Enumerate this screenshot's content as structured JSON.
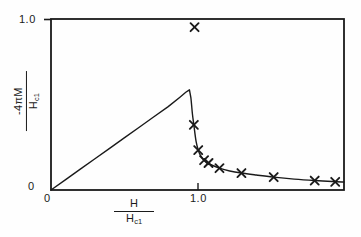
{
  "figure": {
    "background_color": "#fefefe",
    "ink_color": "#1a1a1a"
  },
  "axes": {
    "x_title": {
      "numerator": "H",
      "denominator": "H",
      "denominator_sub": "c1"
    },
    "y_title": {
      "numerator": "-4πM",
      "denominator": "H",
      "denominator_sub": "c1"
    },
    "y_tick_top": "1.0",
    "y_tick_bottom": "0",
    "x_tick_origin": "0",
    "x_tick_one": "1.0"
  },
  "chart_data": {
    "type": "line",
    "title": "",
    "xlabel": "H / H_c1",
    "ylabel": "-4πM / H_c1",
    "xlim": [
      0,
      2.0
    ],
    "ylim": [
      0,
      1.05
    ],
    "grid": false,
    "legend": false,
    "xticks": [
      0,
      1.0
    ],
    "xticklabels": [
      "0",
      "1.0"
    ],
    "yticks": [
      0,
      1.0
    ],
    "yticklabels": [
      "0",
      "1.0"
    ],
    "series": [
      {
        "name": "theoretical curve",
        "style": "solid-line",
        "x": [
          0.0,
          0.1,
          0.2,
          0.3,
          0.4,
          0.5,
          0.6,
          0.7,
          0.8,
          0.88,
          0.92,
          0.945,
          0.955,
          0.965,
          0.975,
          0.99,
          1.005,
          1.02,
          1.045,
          1.07,
          1.1,
          1.15,
          1.22,
          1.3,
          1.4,
          1.52,
          1.66,
          1.8,
          1.92,
          2.0
        ],
        "y": [
          0.0,
          0.064,
          0.128,
          0.192,
          0.256,
          0.32,
          0.384,
          0.448,
          0.512,
          0.57,
          0.6,
          0.615,
          0.565,
          0.47,
          0.4,
          0.3,
          0.245,
          0.212,
          0.183,
          0.166,
          0.152,
          0.134,
          0.117,
          0.104,
          0.092,
          0.079,
          0.067,
          0.058,
          0.052,
          0.049
        ]
      },
      {
        "name": "measured data points",
        "style": "x-markers",
        "x": [
          0.98,
          0.975,
          1.005,
          1.045,
          1.075,
          1.15,
          1.3,
          1.52,
          1.8,
          1.94
        ],
        "y": [
          1.0,
          0.4,
          0.245,
          0.183,
          0.166,
          0.134,
          0.104,
          0.079,
          0.058,
          0.05
        ]
      }
    ],
    "annotations": [
      {
        "text": "linear Meissner region rises from origin to peak near H/H_c1 = 0.95"
      },
      {
        "text": "sharp cusp at the peak followed by steep drop and decaying tail"
      }
    ]
  }
}
